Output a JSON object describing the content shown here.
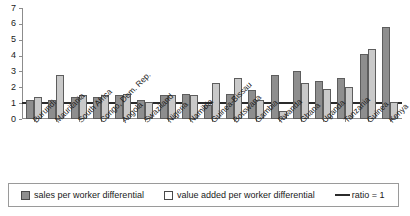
{
  "chart_data": {
    "type": "bar",
    "title": "",
    "xlabel": "",
    "ylabel": "",
    "ylim": [
      0,
      7
    ],
    "yticks": [
      0,
      1,
      2,
      3,
      4,
      5,
      6,
      7
    ],
    "grid": false,
    "legend_position": "bottom",
    "categories": [
      "Burundi",
      "Mauritania",
      "South Africa",
      "Congo, Dem. Rep.",
      "Angola",
      "Swaziland",
      "Nigeria",
      "Namibia",
      "Guinea-Bissau",
      "Botswana",
      "Gambia",
      "Rwanda",
      "Ghana",
      "Uganda",
      "Tanzania",
      "Guinea",
      "Kenya"
    ],
    "series": [
      {
        "name": "sales per worker differential",
        "color": "#8e8e8e",
        "values": [
          1.2,
          1.2,
          1.4,
          1.4,
          1.5,
          1.2,
          1.5,
          1.6,
          0.9,
          1.6,
          1.8,
          2.8,
          3.0,
          2.4,
          2.6,
          4.1,
          5.8
        ]
      },
      {
        "name": "value added per worker differential",
        "color": "#c9c9c9",
        "values": [
          1.4,
          2.8,
          1.5,
          1.5,
          1.6,
          1.1,
          1.5,
          1.5,
          2.3,
          2.6,
          1.2,
          0.5,
          2.3,
          1.9,
          2.0,
          4.4,
          1.1
        ]
      }
    ],
    "reference_line": {
      "label": "ratio = 1",
      "value": 1,
      "color": "#2b2b2b"
    }
  },
  "legend": {
    "items": [
      {
        "label": "sales per worker differential",
        "type": "swatch-filled"
      },
      {
        "label": "value added per worker differential",
        "type": "swatch-open"
      },
      {
        "label": "ratio = 1",
        "type": "line"
      }
    ]
  }
}
